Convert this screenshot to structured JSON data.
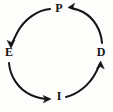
{
  "diagram": {
    "type": "cycle",
    "title": "",
    "direction": "counterclockwise",
    "stroke_color": "#151515",
    "background_color": "#fdfdfc",
    "nodes": [
      {
        "id": "p",
        "label": "P",
        "position": "top"
      },
      {
        "id": "d",
        "label": "D",
        "position": "right"
      },
      {
        "id": "i",
        "label": "I",
        "position": "bottom"
      },
      {
        "id": "e",
        "label": "E",
        "position": "left"
      }
    ],
    "edges": [
      {
        "id": "p-to-e",
        "from": "P",
        "to": "E",
        "style": "curved-arrow",
        "arrowhead": "at-target"
      },
      {
        "id": "e-to-i",
        "from": "E",
        "to": "I",
        "style": "curved-arrow",
        "arrowhead": "at-target"
      },
      {
        "id": "i-to-d",
        "from": "I",
        "to": "D",
        "style": "curved-arrow",
        "arrowhead": "at-target"
      },
      {
        "id": "d-to-p",
        "from": "D",
        "to": "P",
        "style": "curved-arrow",
        "arrowhead": "at-target"
      }
    ]
  }
}
